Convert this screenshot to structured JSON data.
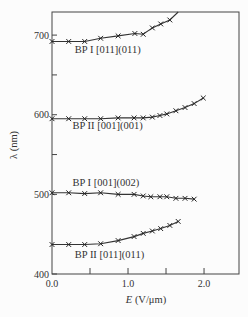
{
  "chart_data": {
    "type": "line",
    "title": "",
    "xlabel": "E (V/μm)",
    "xlabel_var": "E",
    "xlabel_unit": " (V/μm)",
    "ylabel": "λ (nm)",
    "xlim": [
      0.0,
      2.46
    ],
    "ylim": [
      400,
      729
    ],
    "x_ticks": [
      0.0,
      0.5,
      1.0,
      1.5,
      2.0
    ],
    "x_tick_labels": [
      "0.0",
      "",
      "1.0",
      "",
      "2.0"
    ],
    "y_ticks": [
      400,
      500,
      600,
      700
    ],
    "y_tick_labels": [
      "400",
      "500",
      "600",
      "700"
    ],
    "y_minor_ticks": [
      550,
      650
    ],
    "grid": false,
    "legend": "none (inline labels)",
    "marker": "x",
    "series": [
      {
        "name": "BP I [011](011)",
        "label_pos": [
          0.3,
          678
        ],
        "x": [
          0.0,
          0.22,
          0.43,
          0.64,
          0.87,
          1.09,
          1.2,
          1.32,
          1.43,
          1.55
        ],
        "y": [
          692,
          692,
          692,
          696,
          699,
          702,
          701,
          709,
          714,
          719
        ],
        "curve_end": [
          1.66,
          729
        ]
      },
      {
        "name": "BP II [001](001)",
        "label_pos": [
          0.27,
          582
        ],
        "x": [
          0.0,
          0.22,
          0.43,
          0.64,
          0.87,
          1.08,
          1.2,
          1.32,
          1.42,
          1.51,
          1.63,
          1.75,
          1.87,
          1.99
        ],
        "y": [
          595,
          595,
          595,
          595,
          596,
          596,
          596,
          597,
          599,
          601,
          605,
          609,
          614,
          621
        ]
      },
      {
        "name": "BP I [001](002)",
        "label_pos": [
          0.27,
          510
        ],
        "x": [
          0.0,
          0.22,
          0.43,
          0.64,
          0.87,
          1.08,
          1.2,
          1.3,
          1.42,
          1.51,
          1.63,
          1.75,
          1.87
        ],
        "y": [
          502,
          502,
          501,
          502,
          500,
          500,
          498,
          497,
          497,
          497,
          495,
          495,
          494
        ]
      },
      {
        "name": "BP II [011](011)",
        "label_pos": [
          0.3,
          420
        ],
        "x": [
          0.0,
          0.22,
          0.43,
          0.64,
          0.87,
          1.08,
          1.2,
          1.32,
          1.43,
          1.55,
          1.66
        ],
        "y": [
          437,
          437,
          437,
          438,
          442,
          447,
          451,
          454,
          457,
          461,
          466
        ]
      }
    ]
  }
}
